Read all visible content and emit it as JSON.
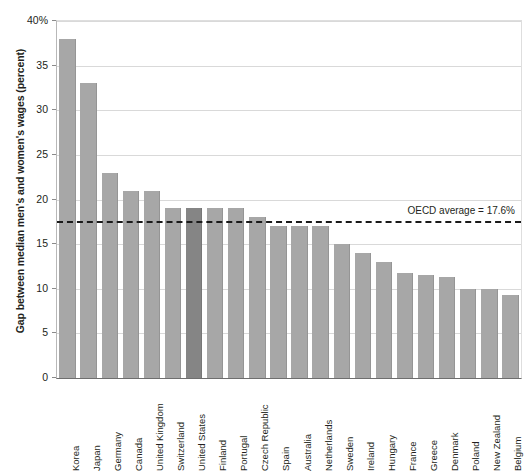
{
  "chart_data": {
    "type": "bar",
    "title": "",
    "xlabel": "",
    "ylabel": "Gap between median men's and women's wages (percent)",
    "ylim": [
      0,
      40
    ],
    "ytick_labels": [
      "40%",
      "35",
      "30",
      "25",
      "20",
      "15",
      "10",
      "5",
      "0"
    ],
    "ytick_values": [
      40,
      35,
      30,
      25,
      20,
      15,
      10,
      5,
      0
    ],
    "grid": true,
    "legend": "none",
    "categories": [
      "Korea",
      "Japan",
      "Germany",
      "Canada",
      "United Kingdom",
      "Switzerland",
      "United States",
      "Finland",
      "Portugal",
      "Czech Republic",
      "Spain",
      "Australia",
      "Netherlands",
      "Sweden",
      "Ireland",
      "Hungary",
      "France",
      "Greece",
      "Denmark",
      "Poland",
      "New Zealand",
      "Belgium"
    ],
    "values": [
      38.0,
      33.0,
      23.0,
      21.0,
      21.0,
      19.0,
      19.0,
      19.0,
      19.0,
      18.0,
      17.0,
      17.0,
      17.0,
      15.0,
      14.0,
      13.0,
      11.8,
      11.5,
      11.3,
      10.0,
      10.0,
      9.3
    ],
    "highlight_category": "United States",
    "bar_color": "#a7a7a7",
    "highlight_color": "#858585",
    "reference_line": {
      "label": "OECD average = 17.6%",
      "value": 17.6,
      "style": "dashed",
      "color": "#1a1a1a"
    }
  }
}
